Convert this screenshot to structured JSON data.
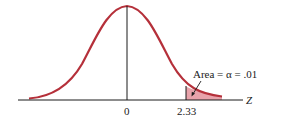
{
  "diagram": {
    "axis_label": "Z",
    "ticks": [
      {
        "label": "0",
        "value": 0
      },
      {
        "label": "2.33",
        "value": 2.33
      }
    ],
    "annotation": "Area = α = .01",
    "colors": {
      "curve": "#b5303a",
      "shade": "#e8a3ab",
      "axis": "#1a1a1a"
    }
  }
}
